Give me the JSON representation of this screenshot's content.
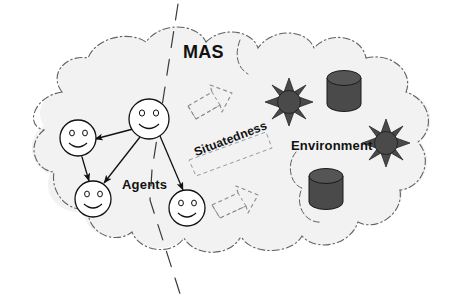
{
  "diagram": {
    "title": "MAS",
    "type": "concept-diagram",
    "background_color": "#ffffff",
    "labels": {
      "mas": "MAS",
      "agents": "Agents",
      "environment": "Environment",
      "situatedness": "Situatedness"
    },
    "regions": [
      {
        "id": "mas-outer-cloud",
        "name": "MAS outer cloud",
        "label": "MAS",
        "style": "dash-dot outline, light gray fill",
        "fill": "#f2f2f2",
        "stroke": "#555555"
      },
      {
        "id": "agents-cloud",
        "name": "Agents sub-cloud",
        "label": "Agents",
        "style": "dashed outline",
        "fill": "#f2f2f2",
        "stroke": "#555555"
      },
      {
        "id": "environment-cloud",
        "name": "Environment sub-cloud",
        "label": "Environment",
        "style": "dashed outline",
        "fill": "#f2f2f2",
        "stroke": "#555555"
      }
    ],
    "divider": {
      "name": "mas-divider-line",
      "style": "long dashed diagonal line",
      "description": "separates agents side from environment side"
    },
    "agents": [
      {
        "id": "agent-top",
        "name": "smiley-agent-top",
        "cx": 149,
        "cy": 119,
        "r": 20
      },
      {
        "id": "agent-left",
        "name": "smiley-agent-left",
        "cx": 78,
        "cy": 138,
        "r": 18
      },
      {
        "id": "agent-bottom",
        "name": "smiley-agent-bottom",
        "cx": 93,
        "cy": 199,
        "r": 18
      },
      {
        "id": "agent-right",
        "name": "smiley-agent-right",
        "cx": 187,
        "cy": 208,
        "r": 18
      }
    ],
    "agent_links": [
      {
        "from": "agent-top",
        "to": "agent-left",
        "arrows": "double"
      },
      {
        "from": "agent-left",
        "to": "agent-bottom",
        "arrows": "double"
      },
      {
        "from": "agent-top",
        "to": "agent-bottom",
        "arrows": "double"
      },
      {
        "from": "agent-top",
        "to": "agent-right",
        "arrows": "double"
      }
    ],
    "environment_objects": [
      {
        "id": "sun-1",
        "name": "sun-resource-1",
        "type": "sun",
        "cx": 289,
        "cy": 102,
        "r": 11,
        "fill": "#4a4a4a"
      },
      {
        "id": "sun-2",
        "name": "sun-resource-2",
        "type": "sun",
        "cx": 386,
        "cy": 143,
        "r": 11,
        "fill": "#4a4a4a"
      },
      {
        "id": "cylinder-1",
        "name": "cylinder-resource-1",
        "type": "cylinder",
        "cx": 344,
        "cy": 92,
        "fill": "#4a4a4a"
      },
      {
        "id": "cylinder-2",
        "name": "cylinder-resource-2",
        "type": "cylinder",
        "cx": 326,
        "cy": 190,
        "fill": "#4a4a4a"
      }
    ],
    "situatedness_arrows": [
      {
        "id": "block-arrow-top",
        "name": "situatedness-block-arrow-top",
        "direction": "right",
        "style": "dashed outline"
      },
      {
        "id": "block-arrow-bottom",
        "name": "situatedness-block-arrow-bottom",
        "direction": "right",
        "style": "dashed outline"
      }
    ],
    "colors": {
      "cloud_fill": "#f2f2f2",
      "cloud_stroke": "#555555",
      "object_fill": "#4a4a4a",
      "object_stroke": "#1a1a1a",
      "line": "#111111",
      "text": "#111111"
    }
  }
}
